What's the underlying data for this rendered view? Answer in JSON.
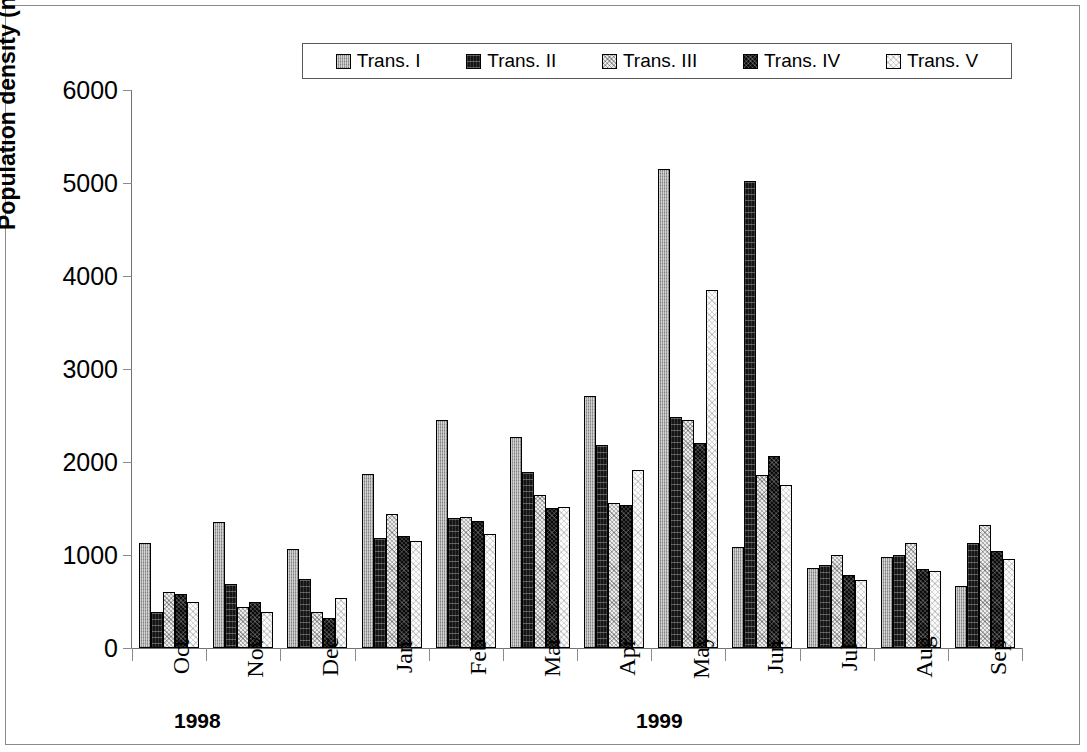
{
  "chart_data": {
    "type": "bar",
    "title": "",
    "xlabel": "",
    "ylabel": "Population density (nos/m²)",
    "ylabel_base": "Population density (nos/m",
    "ylabel_sup": "2",
    "ylabel_tail": ")",
    "ylim": [
      0,
      6000
    ],
    "ytick_step": 1000,
    "yticks": [
      6000,
      5000,
      4000,
      3000,
      2000,
      1000,
      0
    ],
    "ytick_labels": [
      "6000",
      "5000",
      "4000",
      "3000",
      "2000",
      "1000",
      "0"
    ],
    "grid": false,
    "legend_position": "top-center",
    "categories": [
      "Oct",
      "Nov",
      "Dec",
      "Jan",
      "Feb",
      "Mar",
      "Apr",
      "May",
      "Jun",
      "Jul",
      "Aug",
      "Sep"
    ],
    "group_spans": [
      {
        "label": "1998",
        "months": [
          "Oct",
          "Nov",
          "Dec"
        ]
      },
      {
        "label": "1999",
        "months": [
          "Jan",
          "Feb",
          "Mar",
          "Apr",
          "May",
          "Jun",
          "Jul",
          "Aug",
          "Sep"
        ]
      }
    ],
    "series": [
      {
        "name": "Trans. I",
        "pattern": "fill-t1",
        "color": "#9e9e9e",
        "values": [
          1130,
          1360,
          1060,
          1870,
          2450,
          2270,
          2710,
          5150,
          1090,
          860,
          980,
          670
        ]
      },
      {
        "name": "Trans. II",
        "pattern": "fill-t2",
        "color": "#151515",
        "values": [
          390,
          690,
          740,
          1180,
          1400,
          1890,
          2180,
          2480,
          5020,
          890,
          1000,
          1130
        ]
      },
      {
        "name": "Trans. III",
        "pattern": "fill-t3",
        "color": "#ececec",
        "values": [
          600,
          440,
          390,
          1440,
          1410,
          1650,
          1560,
          2450,
          1860,
          1000,
          1130,
          1320
        ]
      },
      {
        "name": "Trans. IV",
        "pattern": "fill-t4",
        "color": "#0b0b0b",
        "values": [
          580,
          490,
          320,
          1200,
          1370,
          1510,
          1540,
          2200,
          2060,
          780,
          850,
          1040
        ]
      },
      {
        "name": "Trans. V",
        "pattern": "fill-t5",
        "color": "#fbfbfb",
        "values": [
          500,
          390,
          540,
          1150,
          1230,
          1520,
          1910,
          3850,
          1750,
          730,
          830,
          960
        ]
      }
    ]
  },
  "legend": {
    "items": [
      {
        "label": "Trans. I",
        "pattern": "fill-t1"
      },
      {
        "label": "Trans. II",
        "pattern": "fill-t2"
      },
      {
        "label": "Trans. III",
        "pattern": "fill-t3"
      },
      {
        "label": "Trans. IV",
        "pattern": "fill-t4"
      },
      {
        "label": "Trans. V",
        "pattern": "fill-t5"
      }
    ]
  }
}
